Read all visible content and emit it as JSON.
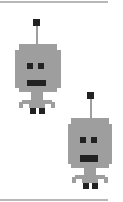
{
  "scene": {
    "description": "Two pixel-art gray robots stacked diagonally between two horizontal rules",
    "colors": {
      "body": "#9e9e9e",
      "features": "#222222",
      "rule": "#b8b8b8",
      "background": "#ffffff"
    },
    "robots": [
      {
        "name": "robot-1",
        "x": 14,
        "y": 18
      },
      {
        "name": "robot-2",
        "x": 66,
        "y": 91
      }
    ]
  }
}
